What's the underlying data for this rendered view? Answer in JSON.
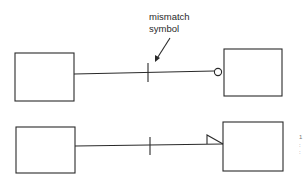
{
  "diagram": {
    "annotation": {
      "line1": "mismatch",
      "line2": "symbol"
    },
    "rows": [
      {
        "id": "top",
        "left_entity": "",
        "right_entity": "",
        "connector_end": "circle",
        "mismatch_marker": "tick"
      },
      {
        "id": "bottom",
        "left_entity": "",
        "right_entity": "",
        "connector_end": "triangle",
        "mismatch_marker": "tick"
      }
    ],
    "edge_fragments": [
      "1",
      ":",
      ":"
    ],
    "colors": {
      "stroke": "#2a2a2a",
      "background": "#ffffff"
    }
  }
}
